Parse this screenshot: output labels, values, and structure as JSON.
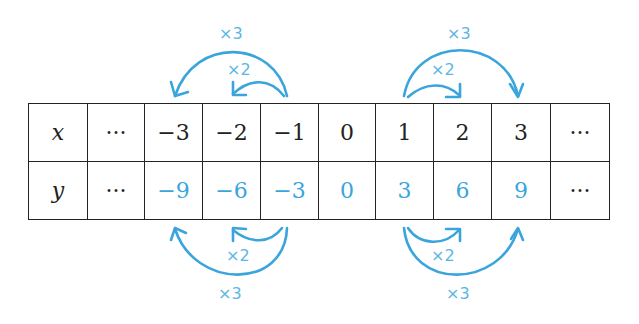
{
  "table": {
    "x_row": {
      "label": "x",
      "cells": [
        "···",
        "−3",
        "−2",
        "−1",
        "0",
        "1",
        "2",
        "3",
        "···"
      ]
    },
    "y_row": {
      "label": "y",
      "cells": [
        "···",
        "−9",
        "−6",
        "−3",
        "0",
        "3",
        "6",
        "9",
        "···"
      ]
    }
  },
  "arrows": {
    "top_left_x3": "×3",
    "top_left_x2": "×2",
    "top_right_x3": "×3",
    "top_right_x2": "×2",
    "bottom_left_x2": "×2",
    "bottom_left_x3": "×3",
    "bottom_right_x2": "×2",
    "bottom_right_x3": "×3"
  },
  "colors": {
    "accent": "#3aa5dc",
    "line": "#222222"
  }
}
